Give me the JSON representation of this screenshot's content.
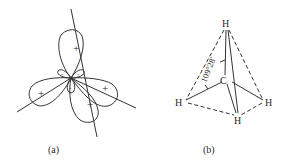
{
  "figure_a": {
    "caption": "(a)",
    "lobe_signs": {
      "top": "+",
      "left": "+",
      "right": "+",
      "bottom_right": "+",
      "small_upper_left": "-",
      "small_upper_right": "-",
      "small_lower": "-"
    }
  },
  "figure_b": {
    "caption": "(b)",
    "center_atom": "C",
    "atoms": {
      "top": "H",
      "left": "H",
      "right": "H",
      "bottom": "H"
    },
    "bond_angle": "109°28'"
  },
  "colors": {
    "line": "#333333",
    "background": "#ffffff"
  }
}
